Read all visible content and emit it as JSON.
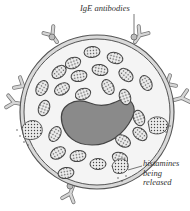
{
  "diagram": {
    "labels": {
      "ige_antibodies": "IgE antibodies",
      "histamines_line1": "histamines",
      "histamines_line2": "being",
      "histamines_line3": "released"
    },
    "colors": {
      "outline": "#555555",
      "membrane_fill": "#d9d9d9",
      "nucleus": "#8a8a8a",
      "granule_fill": "#9a9a9a",
      "antibody_fill": "#cfcfcf"
    }
  }
}
